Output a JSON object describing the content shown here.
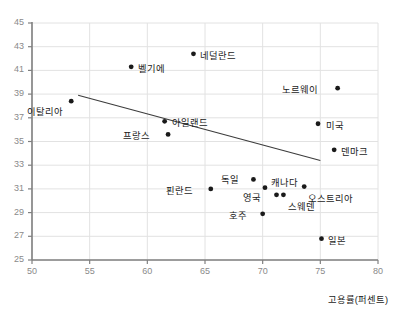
{
  "chart_data": {
    "type": "scatter",
    "title": "",
    "xlabel": "고용률(퍼센트)",
    "ylabel": "",
    "xlim": [
      50,
      80
    ],
    "ylim": [
      25,
      45
    ],
    "xticks": [
      "50",
      "55",
      "60",
      "65",
      "70",
      "75",
      "80"
    ],
    "yticks": [
      "45",
      "43",
      "41",
      "39",
      "37",
      "35",
      "33",
      "31",
      "29",
      "27",
      "25"
    ],
    "grid": true,
    "legend": "none",
    "trendline": {
      "label": "추세선",
      "x1": 54.0,
      "y1": 38.9,
      "x2": 75.0,
      "y2": 33.4
    },
    "points": [
      {
        "label": "이탈리아",
        "x": 53.4,
        "y": 38.4,
        "label_dx": -34,
        "label_dy": 9
      },
      {
        "label": "벨기에",
        "x": 58.6,
        "y": 41.3,
        "label_dx": 7,
        "label_dy": 0
      },
      {
        "label": "네덜란드",
        "x": 64.0,
        "y": 42.4,
        "label_dx": 7,
        "label_dy": 0
      },
      {
        "label": "아일랜드",
        "x": 61.5,
        "y": 36.7,
        "label_dx": 7,
        "label_dy": 0
      },
      {
        "label": "프랑스",
        "x": 61.8,
        "y": 35.6,
        "label_dx": -35,
        "label_dy": 0
      },
      {
        "label": "핀란드",
        "x": 65.5,
        "y": 31.0,
        "label_dx": -35,
        "label_dy": 0
      },
      {
        "label": "독일",
        "x": 69.2,
        "y": 31.8,
        "label_dx": -22,
        "label_dy": -1
      },
      {
        "label": "캐나다",
        "x": 70.2,
        "y": 31.1,
        "label_dx": 6,
        "label_dy": -7
      },
      {
        "label": "영국",
        "x": 71.2,
        "y": 30.5,
        "label_dx": -24,
        "label_dy": 1
      },
      {
        "label": "스웨덴",
        "x": 71.8,
        "y": 30.5,
        "label_dx": 5,
        "label_dy": 10
      },
      {
        "label": "오스트리아",
        "x": 73.6,
        "y": 31.2,
        "label_dx": 4,
        "label_dy": 10
      },
      {
        "label": "호주",
        "x": 70.0,
        "y": 28.9,
        "label_dx": -24,
        "label_dy": 0
      },
      {
        "label": "노르웨이",
        "x": 76.5,
        "y": 39.5,
        "label_dx": -46,
        "label_dy": 0
      },
      {
        "label": "미국",
        "x": 74.8,
        "y": 36.5,
        "label_dx": 8,
        "label_dy": 0
      },
      {
        "label": "덴마크",
        "x": 76.2,
        "y": 34.3,
        "label_dx": 7,
        "label_dy": 0
      },
      {
        "label": "일본",
        "x": 75.1,
        "y": 26.8,
        "label_dx": 7,
        "label_dy": 0
      }
    ],
    "style": {
      "point_color": "#1a1a1a",
      "grid_color": "#e2e2e2",
      "axis_color": "#808080",
      "tick_text_color": "#8a8a8a",
      "trendline_color": "#3c3c3c"
    }
  }
}
